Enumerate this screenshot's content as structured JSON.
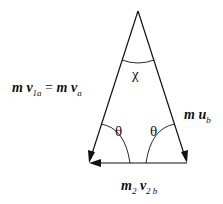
{
  "diagram": {
    "title": "",
    "labels": {
      "left_side": {
        "m": "m",
        "v": "v",
        "sub": "1a",
        "eq": "=",
        "m2": "m",
        "v2": "v",
        "sub2": "a"
      },
      "right_side": {
        "m": "m",
        "u": "u",
        "sub": "b"
      },
      "bottom_side": {
        "m": "m",
        "msub": "2",
        "v": "v",
        "sub": "2 b"
      },
      "apex_angle": "χ",
      "base_angle_left": "θ",
      "base_angle_right": "θ"
    },
    "colors": {
      "line": "#111111",
      "background": "#ffffff"
    }
  }
}
